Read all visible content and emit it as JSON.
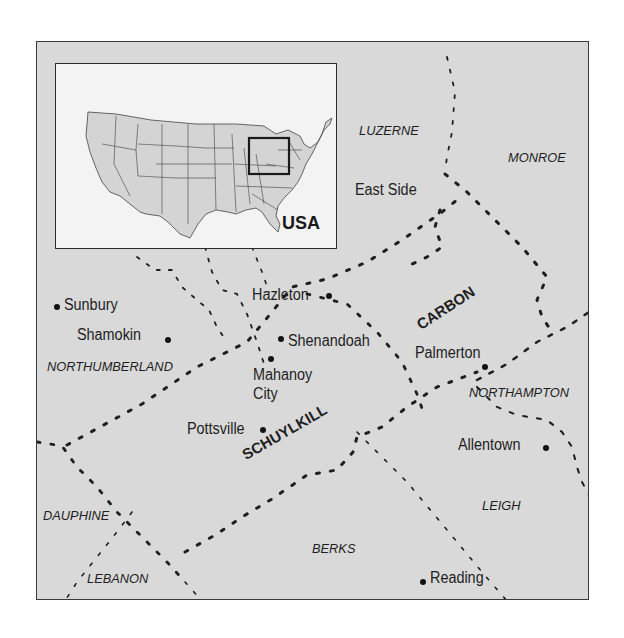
{
  "map": {
    "title": "Anthracite coal region of Pennsylvania",
    "inset": {
      "label": "USA",
      "highlight": "northeastern Pennsylvania"
    },
    "cities": [
      {
        "id": "east-side",
        "name": "East Side"
      },
      {
        "id": "hazleton",
        "name": "Hazleton"
      },
      {
        "id": "sunbury",
        "name": "Sunbury"
      },
      {
        "id": "shamokin",
        "name": "Shamokin"
      },
      {
        "id": "shenandoah",
        "name": "Shenandoah"
      },
      {
        "id": "mahanoy-city",
        "name": "Mahanoy City",
        "line1": "Mahanoy",
        "line2": "City"
      },
      {
        "id": "pottsville",
        "name": "Pottsville"
      },
      {
        "id": "palmerton",
        "name": "Palmerton"
      },
      {
        "id": "allentown",
        "name": "Allentown"
      },
      {
        "id": "reading",
        "name": "Reading"
      }
    ],
    "counties": [
      {
        "id": "luzerne",
        "name": "LUZERNE"
      },
      {
        "id": "monroe",
        "name": "MONROE"
      },
      {
        "id": "northumberland",
        "name": "NORTHUMBERLAND"
      },
      {
        "id": "northampton",
        "name": "NORTHAMPTON"
      },
      {
        "id": "dauphine",
        "name": "DAUPHINE"
      },
      {
        "id": "leigh",
        "name": "LEIGH"
      },
      {
        "id": "berks",
        "name": "BERKS"
      },
      {
        "id": "lebanon",
        "name": "LEBANON"
      }
    ],
    "major_counties": [
      {
        "id": "schuylkill",
        "name": "SCHUYLKILL"
      },
      {
        "id": "carbon",
        "name": "CARBON"
      }
    ],
    "colors": {
      "land": "#d9d9d9",
      "inset_bg": "#f3f3f3",
      "inset_land": "#d4d4d4",
      "text": "#1e1e1e",
      "boundary": "#222222"
    }
  }
}
